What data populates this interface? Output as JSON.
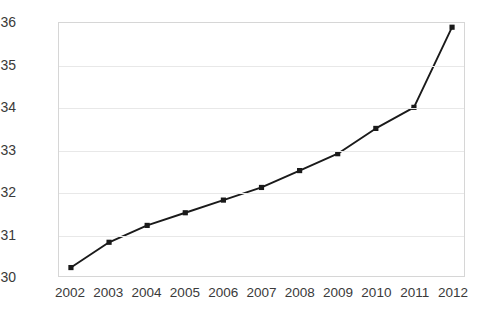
{
  "chart_data": {
    "type": "line",
    "title": "",
    "subtitle": "",
    "xlabel": "",
    "ylabel": "",
    "categories": [
      "2002",
      "2003",
      "2004",
      "2005",
      "2006",
      "2007",
      "2008",
      "2009",
      "2010",
      "2011",
      "2012"
    ],
    "values": [
      30.2,
      30.8,
      31.2,
      31.5,
      31.8,
      32.1,
      32.5,
      32.9,
      33.5,
      34.0,
      35.9
    ],
    "series": [
      {
        "name": "",
        "values": [
          30.2,
          30.8,
          31.2,
          31.5,
          31.8,
          32.1,
          32.5,
          32.9,
          33.5,
          34.0,
          35.9
        ]
      }
    ],
    "ylim": [
      30,
      36
    ],
    "xlim": [
      "2002",
      "2012"
    ],
    "yticks": [
      30,
      31,
      32,
      33,
      34,
      35,
      36
    ],
    "ytick_labels": [
      "30",
      "31",
      "32",
      "33",
      "34",
      "35",
      "36"
    ],
    "xtick_labels": [
      "2002",
      "2003",
      "2004",
      "2005",
      "2006",
      "2007",
      "2008",
      "2009",
      "2010",
      "2011",
      "2012"
    ],
    "grid": true,
    "grid_axis": "y",
    "legend": false,
    "legend_position": "none",
    "marker": "square",
    "line_color": "#1a1a1a",
    "marker_color": "#1a1a1a",
    "grid_color": "#e8e8e8",
    "axis_color": "#d6d6d6",
    "tick_label_color": "#3a3a3a",
    "background_color": "#ffffff",
    "annotations": []
  }
}
